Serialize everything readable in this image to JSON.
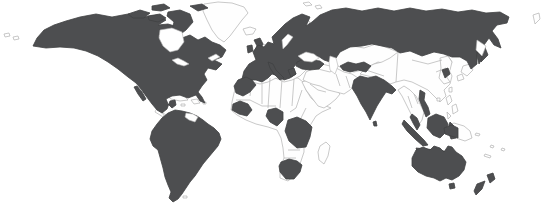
{
  "map": {
    "type": "world-choropleth",
    "description": "World map with highlighted countries filled dark gray and remaining countries shown as white with light gray borders",
    "background": "#ffffff",
    "colors": {
      "highlighted": "#4d4e50",
      "highlighted_stroke": "#404143",
      "unhighlighted": "#fefefe",
      "border": "#b2b2b2"
    },
    "highlighted_regions": [
      "Canada",
      "United States",
      "Alaska",
      "Mexico",
      "Colombia",
      "Venezuela",
      "Ecuador",
      "Peru",
      "Brazil",
      "Bolivia",
      "Chile",
      "Argentina",
      "Paraguay",
      "Uruguay",
      "United Kingdom",
      "Ireland",
      "Spain",
      "Portugal",
      "France",
      "Germany",
      "Italy",
      "Scandinavia",
      "Eastern Europe",
      "Russia",
      "Turkey",
      "Uzbekistan",
      "India",
      "Sri Lanka",
      "South Korea",
      "Vietnam",
      "Malaysia",
      "Indonesia",
      "Morocco",
      "Senegal-Guinea",
      "Nigeria",
      "DR Congo",
      "South Africa",
      "Australia",
      "Tasmania",
      "New Zealand"
    ],
    "outlined_regions": [
      "Greenland",
      "Iceland",
      "Central America",
      "Cuba",
      "Hispaniola",
      "Guyanas",
      "North Africa",
      "Egypt",
      "Sudan",
      "Ethiopia",
      "Kenya",
      "Tanzania",
      "Madagascar",
      "Arabia",
      "Iran",
      "Kazakhstan",
      "China",
      "Mongolia",
      "Japan",
      "North Korea",
      "Myanmar",
      "Thailand",
      "Philippines",
      "Taiwan",
      "Papua New Guinea",
      "Pacific Islands",
      "New Caledonia",
      "Falkland Islands",
      "Svalbard",
      "Novaya Zemlya"
    ]
  }
}
